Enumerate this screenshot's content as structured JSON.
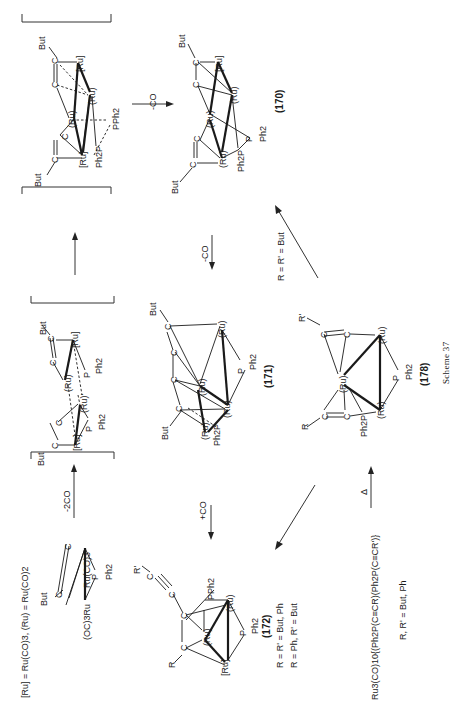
{
  "caption": "Scheme 37",
  "legend": {
    "definition": "[Ru] = Ru(CO)3,  (Ru) = Ru(CO)2"
  },
  "compounds": {
    "start": {
      "labels": [
        "But",
        "C",
        "C",
        "Ru(CO)3",
        "(OC)3Ru",
        "P",
        "Ph2"
      ]
    },
    "int1": {
      "labels": [
        "But",
        "C",
        "C",
        "[Ru]",
        "(Ru)",
        "P",
        "Ph2",
        "But",
        "C",
        "C",
        "(Ru)'",
        "[Ru]",
        "P",
        "Ph2"
      ]
    },
    "int2": {
      "labels": [
        "But",
        "C",
        "C",
        "[Ru]",
        "(Ru)",
        "(Ru)",
        "PPh2",
        "But",
        "C",
        "C",
        "[Ru]",
        "Ph2P"
      ]
    },
    "c170": {
      "number": "(170)",
      "labels": [
        "But",
        "C",
        "C",
        "[Ru]",
        "(Ru)",
        "(Ru)",
        "C",
        "C",
        "But",
        "(Ru)",
        "P",
        "Ph2",
        "Ph2P"
      ]
    },
    "c171": {
      "number": "(171)",
      "labels": [
        "But",
        "C",
        "C",
        "C",
        "C",
        "But",
        "(Ru)",
        "(Ru)",
        "(Ru)",
        "(Ru)",
        "P",
        "Ph2",
        "Ph2P"
      ]
    },
    "c172": {
      "number": "(172)",
      "labels": [
        "R'",
        "C",
        "C",
        "C",
        "C",
        "R",
        "PPh2",
        "(Ru)",
        "(Ru)",
        "[Ru]",
        "P",
        "Ph2"
      ],
      "conditions": [
        "R = R' = But, Ph",
        "R = Ph, R' = But"
      ]
    },
    "c178": {
      "number": "(178)",
      "labels": [
        "R'",
        "C",
        "C",
        "R",
        "C",
        "C",
        "(Ru)",
        "(Ru)",
        "(Ru)",
        "P",
        "Ph2",
        "Ph2P"
      ]
    },
    "precursor": {
      "formula": "Ru3(CO)10{(Ph2P(C≡CR)(Ph2P(C≡CR')}",
      "condition": "R, R' = But, Ph"
    }
  },
  "arrows": {
    "start_to_int1": "-2CO",
    "int1_to_int2": "",
    "int2_to_170": "-CO",
    "c170_to_171": "-CO",
    "c171_to_172": "+CO",
    "c178_to_170": "R = R' = But",
    "c178_to_172": "",
    "precursor_to_178": "Δ"
  }
}
